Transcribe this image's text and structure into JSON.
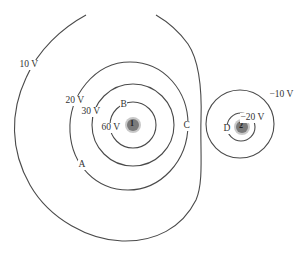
{
  "diagram": {
    "type": "equipotential-lines",
    "charges": [
      {
        "id": "charge-1",
        "label": "1",
        "color": "#7a7a7a"
      },
      {
        "id": "charge-2",
        "label": "2",
        "color": "#7a7a7a"
      }
    ],
    "equipotentials": [
      {
        "value": "10 V",
        "around": "1"
      },
      {
        "value": "20 V",
        "around": "1"
      },
      {
        "value": "30 V",
        "around": "1"
      },
      {
        "value": "60 V",
        "around": "1"
      },
      {
        "value": "−10 V",
        "around": "2"
      },
      {
        "value": "−20 V",
        "around": "2"
      }
    ],
    "points": [
      {
        "label": "A"
      },
      {
        "label": "B"
      },
      {
        "label": "C"
      },
      {
        "label": "D"
      }
    ],
    "line_color": "#4a4a4a"
  }
}
